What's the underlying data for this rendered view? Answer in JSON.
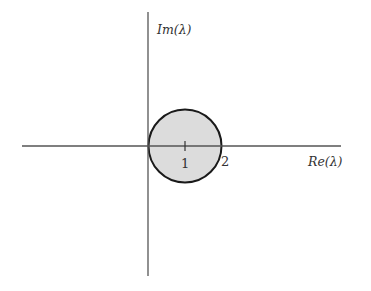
{
  "diagram": {
    "title": "",
    "axes": {
      "x_label": "Re(λ)",
      "y_label": "Im(λ)",
      "axis_color": "#555555"
    },
    "region": {
      "shape": "disk",
      "center": [
        1,
        0
      ],
      "radius": 1,
      "fill": "#dcdcdc",
      "stroke": "#1a1a1a"
    },
    "ticks": [
      {
        "value": 1,
        "label": "1"
      },
      {
        "value": 2,
        "label": "2"
      }
    ]
  }
}
